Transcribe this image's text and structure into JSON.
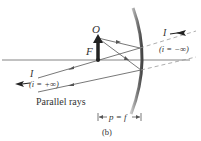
{
  "diagram": {
    "type": "concave-mirror-ray-diagram",
    "object_label": "O",
    "focal_label": "F",
    "image_label_right": "I",
    "image_location_right": "(i = −∞)",
    "image_label_left": "I",
    "image_location_left": "(i = +∞)",
    "parallel_rays_label": "Parallel rays",
    "distance_label": "p = f",
    "panel_label": "(b)",
    "colors": {
      "ray": "#555555",
      "axis": "#666666",
      "object_arrow": "#222222",
      "mirror": "#777777",
      "virtual_ray": "#999999",
      "text": "#333333"
    }
  }
}
